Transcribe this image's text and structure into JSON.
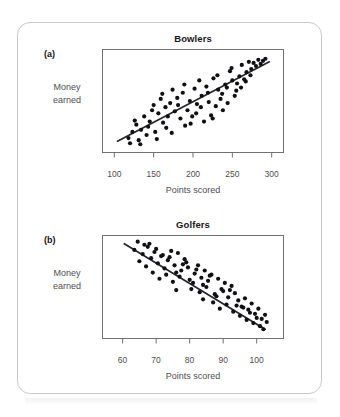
{
  "figure": {
    "panels": [
      {
        "letter": "(a)",
        "title": "Bowlers",
        "y_label_line1": "Money",
        "y_label_line2": "earned",
        "x_label": "Points scored"
      },
      {
        "letter": "(b)",
        "title": "Golfers",
        "y_label_line1": "Money",
        "y_label_line2": "earned",
        "x_label": "Points scored"
      }
    ],
    "colors": {
      "point": "#101014",
      "trend_line": "#26262a",
      "frame": "#6f6f74",
      "card_border": "#c9c9c9",
      "text": "#16161a",
      "axis_text": "#4e4e52"
    }
  },
  "chart_data": [
    {
      "type": "scatter",
      "title": "Bowlers",
      "panel": "(a)",
      "xlabel": "Points scored",
      "ylabel": "Money earned",
      "xticks": [
        100,
        150,
        200,
        250,
        300
      ],
      "xticklabels": [
        "100",
        "150",
        "200",
        "250",
        "300"
      ],
      "yticks": [],
      "yticklabels": [],
      "xlim": [
        85,
        315
      ],
      "ylim": [
        0,
        100
      ],
      "grid": false,
      "legend": false,
      "correlation": "positive",
      "annotation": "Positive correlation: money earned increases with points scored",
      "trend_line": {
        "x": [
          104,
          297
        ],
        "y": [
          11,
          88
        ]
      },
      "points": [
        [
          118,
          14
        ],
        [
          123,
          20
        ],
        [
          120,
          9
        ],
        [
          128,
          27
        ],
        [
          131,
          12
        ],
        [
          126,
          31
        ],
        [
          134,
          22
        ],
        [
          138,
          35
        ],
        [
          133,
          8
        ],
        [
          141,
          17
        ],
        [
          145,
          30
        ],
        [
          148,
          41
        ],
        [
          143,
          25
        ],
        [
          152,
          20
        ],
        [
          150,
          46
        ],
        [
          156,
          38
        ],
        [
          159,
          52
        ],
        [
          154,
          13
        ],
        [
          162,
          29
        ],
        [
          165,
          44
        ],
        [
          161,
          57
        ],
        [
          168,
          35
        ],
        [
          171,
          48
        ],
        [
          166,
          24
        ],
        [
          174,
          61
        ],
        [
          177,
          40
        ],
        [
          173,
          19
        ],
        [
          180,
          53
        ],
        [
          184,
          33
        ],
        [
          181,
          46
        ],
        [
          187,
          58
        ],
        [
          190,
          26
        ],
        [
          193,
          41
        ],
        [
          189,
          66
        ],
        [
          196,
          50
        ],
        [
          199,
          35
        ],
        [
          202,
          62
        ],
        [
          197,
          28
        ],
        [
          205,
          47
        ],
        [
          208,
          70
        ],
        [
          204,
          38
        ],
        [
          211,
          55
        ],
        [
          214,
          30
        ],
        [
          210,
          44
        ],
        [
          217,
          64
        ],
        [
          220,
          49
        ],
        [
          223,
          36
        ],
        [
          219,
          58
        ],
        [
          226,
          72
        ],
        [
          229,
          45
        ],
        [
          225,
          33
        ],
        [
          232,
          61
        ],
        [
          235,
          52
        ],
        [
          231,
          75
        ],
        [
          238,
          41
        ],
        [
          241,
          66
        ],
        [
          237,
          57
        ],
        [
          244,
          48
        ],
        [
          247,
          79
        ],
        [
          243,
          63
        ],
        [
          250,
          70
        ],
        [
          253,
          55
        ],
        [
          249,
          82
        ],
        [
          256,
          67
        ],
        [
          259,
          74
        ],
        [
          255,
          60
        ],
        [
          262,
          85
        ],
        [
          265,
          71
        ],
        [
          261,
          63
        ],
        [
          268,
          78
        ],
        [
          271,
          88
        ],
        [
          267,
          69
        ],
        [
          274,
          81
        ],
        [
          277,
          87
        ],
        [
          273,
          75
        ],
        [
          280,
          84
        ],
        [
          283,
          90
        ],
        [
          286,
          86
        ],
        [
          289,
          89
        ],
        [
          292,
          91
        ]
      ]
    },
    {
      "type": "scatter",
      "title": "Golfers",
      "panel": "(b)",
      "xlabel": "Points scored",
      "ylabel": "Money earned",
      "xticks": [
        60,
        70,
        80,
        90,
        100
      ],
      "xticklabels": [
        "60",
        "70",
        "80",
        "90",
        "100"
      ],
      "yticks": [],
      "yticklabels": [],
      "xlim": [
        54,
        108
      ],
      "ylim": [
        0,
        100
      ],
      "grid": false,
      "legend": false,
      "correlation": "negative",
      "annotation": "Negative correlation: money earned decreases as points scored increase",
      "trend_line": {
        "x": [
          60.5,
          102.5
        ],
        "y": [
          92,
          9
        ]
      },
      "points": [
        [
          63.5,
          86
        ],
        [
          64.5,
          94
        ],
        [
          66,
          82
        ],
        [
          65,
          75
        ],
        [
          67.5,
          89
        ],
        [
          68.5,
          78
        ],
        [
          67,
          70
        ],
        [
          69.5,
          84
        ],
        [
          70.5,
          73
        ],
        [
          69,
          64
        ],
        [
          71.5,
          80
        ],
        [
          72.5,
          68
        ],
        [
          71,
          58
        ],
        [
          73.5,
          76
        ],
        [
          74.5,
          85
        ],
        [
          73,
          62
        ],
        [
          75.5,
          71
        ],
        [
          76.5,
          83
        ],
        [
          75,
          55
        ],
        [
          77.5,
          66
        ],
        [
          78.5,
          77
        ],
        [
          77,
          60
        ],
        [
          79.5,
          69
        ],
        [
          80.5,
          48
        ],
        [
          79,
          74
        ],
        [
          81.5,
          63
        ],
        [
          82.5,
          71
        ],
        [
          81,
          54
        ],
        [
          83.5,
          59
        ],
        [
          84.5,
          66
        ],
        [
          83,
          45
        ],
        [
          85.5,
          56
        ],
        [
          86.5,
          62
        ],
        [
          85,
          50
        ],
        [
          87.5,
          43
        ],
        [
          88.5,
          58
        ],
        [
          87,
          35
        ],
        [
          89.5,
          48
        ],
        [
          90.5,
          54
        ],
        [
          89,
          29
        ],
        [
          91.5,
          40
        ],
        [
          92.5,
          51
        ],
        [
          91,
          33
        ],
        [
          93.5,
          44
        ],
        [
          94.5,
          37
        ],
        [
          93,
          26
        ],
        [
          95.5,
          31
        ],
        [
          96.5,
          39
        ],
        [
          95,
          22
        ],
        [
          97.5,
          28
        ],
        [
          98.5,
          34
        ],
        [
          97,
          18
        ],
        [
          99.5,
          24
        ],
        [
          100.5,
          29
        ],
        [
          99,
          15
        ],
        [
          101.5,
          19
        ],
        [
          102.5,
          23
        ],
        [
          101,
          12
        ],
        [
          103,
          16
        ],
        [
          102,
          9
        ],
        [
          66.5,
          91
        ],
        [
          70,
          87
        ],
        [
          74,
          79
        ],
        [
          78,
          72
        ],
        [
          82,
          67
        ],
        [
          86,
          61
        ],
        [
          90,
          46
        ],
        [
          94,
          32
        ],
        [
          98,
          25
        ],
        [
          100,
          20
        ],
        [
          68,
          92
        ],
        [
          72,
          81
        ],
        [
          76,
          64
        ],
        [
          80,
          57
        ],
        [
          84,
          52
        ],
        [
          88,
          41
        ],
        [
          92,
          47
        ],
        [
          96,
          30
        ],
        [
          76,
          47
        ],
        [
          84,
          38
        ]
      ]
    }
  ]
}
